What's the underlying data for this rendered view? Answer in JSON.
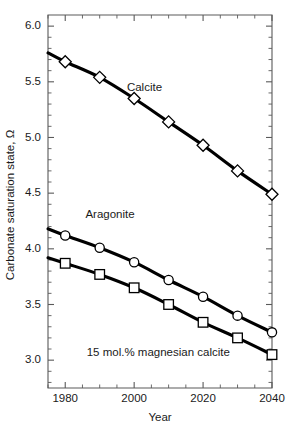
{
  "chart_data": {
    "type": "line",
    "title": "",
    "xlabel": "Year",
    "ylabel": "Carbonate saturation state, Ω",
    "xlim": [
      1975,
      2040
    ],
    "ylim": [
      2.75,
      6.1
    ],
    "grid": false,
    "legend_position": "inline-annotations",
    "xticks": [
      1980,
      2000,
      2020,
      2040
    ],
    "xticklabels": [
      "1980",
      "2000",
      "2020",
      "2040"
    ],
    "xminorticks": [
      1975,
      1985,
      1990,
      1995,
      2005,
      2010,
      2015,
      2025,
      2030,
      2035
    ],
    "yticks": [
      3.0,
      3.5,
      4.0,
      4.5,
      5.0,
      5.5,
      6.0
    ],
    "yticklabels": [
      "3.0",
      "3.5",
      "4.0",
      "4.5",
      "5.0",
      "5.5",
      "6.0"
    ],
    "yminorticks": [
      2.8,
      2.9,
      3.1,
      3.2,
      3.3,
      3.4,
      3.6,
      3.7,
      3.8,
      3.9,
      4.1,
      4.2,
      4.3,
      4.4,
      4.6,
      4.7,
      4.8,
      4.9,
      5.1,
      5.2,
      5.3,
      5.4,
      5.6,
      5.7,
      5.8,
      5.9
    ],
    "x": [
      1975,
      1980,
      1990,
      2000,
      2010,
      2020,
      2030,
      2040
    ],
    "series": [
      {
        "name": "Calcite",
        "marker": "diamond",
        "label_x": 2003,
        "label_y": 5.42,
        "values": [
          5.76,
          5.68,
          5.54,
          5.35,
          5.14,
          4.93,
          4.7,
          4.49
        ]
      },
      {
        "name": "Aragonite",
        "marker": "circle",
        "label_x": 1993,
        "label_y": 4.28,
        "values": [
          4.18,
          4.12,
          4.01,
          3.88,
          3.72,
          3.57,
          3.4,
          3.25
        ]
      },
      {
        "name": "15 mol.% magnesian calcite",
        "marker": "square",
        "label_x": 2007,
        "label_y": 3.04,
        "values": [
          3.92,
          3.87,
          3.77,
          3.65,
          3.5,
          3.34,
          3.2,
          3.05
        ]
      }
    ]
  },
  "axes": {
    "x_title": "Year",
    "y_title": "Carbonate saturation state, Ω"
  },
  "colors": {
    "line": "#000000",
    "marker_fill": "#ffffff",
    "axis": "#5a5a5a",
    "text": "#1a1a1a",
    "background": "#ffffff"
  }
}
